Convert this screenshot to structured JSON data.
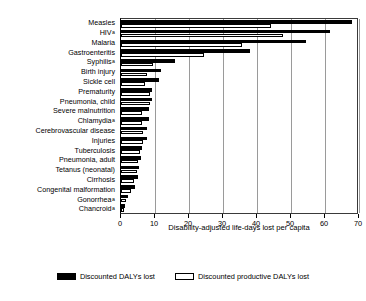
{
  "chart_data": {
    "type": "bar",
    "orientation": "horizontal",
    "title": "",
    "xlabel": "Disability-adjusted life-days lost per capita",
    "ylabel": "",
    "xlim": [
      0,
      70
    ],
    "xticks": [
      0,
      10,
      20,
      30,
      40,
      50,
      60,
      70
    ],
    "grid": "vertical",
    "legend_position": "bottom",
    "categories": [
      "Measles",
      "HIV",
      "Malaria",
      "Gastroenteritis",
      "Syphilis",
      "Birth injury",
      "Sickle cell",
      "Prematurity",
      "Pneumonia, child",
      "Severe malnutrition",
      "Chlamydia",
      "Cerebrovascular disease",
      "Injuries",
      "Tuberculosis",
      "Pneumonia, adult",
      "Tetanus (neonatal)",
      "Cirrhosis",
      "Congenital malformation",
      "Gonorrhea",
      "Chancroid"
    ],
    "category_footnotes": {
      "HIV": "a",
      "Syphilis": "a",
      "Chlamydia": "a",
      "Gonorrhea": "a",
      "Chancroid": "a"
    },
    "footnote_marker": "a",
    "series": [
      {
        "name": "Discounted DALYs lost",
        "color": "#000000",
        "values": [
          68.0,
          61.5,
          54.5,
          38.0,
          16.0,
          11.8,
          11.3,
          9.2,
          9.0,
          8.2,
          8.2,
          7.7,
          7.6,
          6.3,
          6.0,
          5.2,
          5.0,
          4.2,
          2.0,
          1.3
        ]
      },
      {
        "name": "Discounted productive DALYs lost",
        "color": "#ffffff",
        "values": [
          44.0,
          47.5,
          35.5,
          24.5,
          9.3,
          7.6,
          7.0,
          8.6,
          8.4,
          6.2,
          6.3,
          6.6,
          6.5,
          5.6,
          5.0,
          4.6,
          3.7,
          2.8,
          1.5,
          0.9
        ]
      }
    ]
  },
  "legend": {
    "items": [
      {
        "label": "Discounted DALYs lost",
        "swatch": "filled-black"
      },
      {
        "label": "Discounted productive DALYs lost",
        "swatch": "outlined-white"
      }
    ]
  },
  "axis": {
    "x_title": "Disability-adjusted life-days lost per capita",
    "x_tick_labels": [
      "0",
      "10",
      "20",
      "30",
      "40",
      "50",
      "60",
      "70"
    ]
  }
}
